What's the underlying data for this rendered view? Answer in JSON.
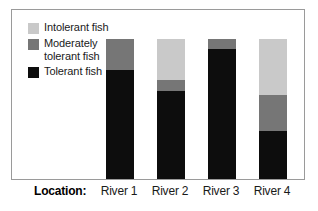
{
  "chart_data": {
    "type": "bar",
    "subtype": "stacked-bar-100pct",
    "title": "",
    "xlabel": "Location:",
    "ylabel": "",
    "ylim": [
      0,
      100
    ],
    "grid": false,
    "legend_position": "top-left",
    "categories": [
      "River 1",
      "River 2",
      "River 3",
      "River 4"
    ],
    "series": [
      {
        "name": "Tolerant fish",
        "color": "#0d0d0d",
        "values": [
          78,
          63,
          93,
          34
        ]
      },
      {
        "name": "Moderately tolerant fish",
        "color": "#767676",
        "values": [
          22,
          8,
          7,
          26
        ]
      },
      {
        "name": "Intolerant fish",
        "color": "#c9c9c9",
        "values": [
          0,
          29,
          0,
          40
        ]
      }
    ],
    "stack_order_bottom_to_top": [
      "Tolerant fish",
      "Moderately tolerant fish",
      "Intolerant fish"
    ]
  },
  "legend": {
    "entries": [
      {
        "label": "Intolerant fish",
        "color": "#c9c9c9",
        "swatch_name": "legend-swatch-intolerant"
      },
      {
        "label": "Moderately tolerant fish",
        "color": "#767676",
        "swatch_name": "legend-swatch-moderately-tolerant"
      },
      {
        "label": "Tolerant fish",
        "color": "#0d0d0d",
        "swatch_name": "legend-swatch-tolerant"
      }
    ]
  },
  "axis": {
    "title": "Location:",
    "ticks": [
      "River 1",
      "River 2",
      "River 3",
      "River 4"
    ]
  },
  "colors": {
    "frame": "#9a9a9a",
    "background": "#ffffff",
    "text": "#1a1a1a",
    "intolerant": "#c9c9c9",
    "moderately_tolerant": "#767676",
    "tolerant": "#0d0d0d"
  }
}
